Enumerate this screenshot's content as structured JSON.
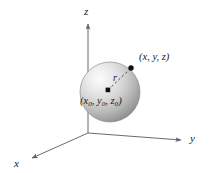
{
  "figure": {
    "background_color": "#ffffff",
    "line_color": "#6b6b6b",
    "text_color": "#1a1a1a"
  },
  "axes": [
    {
      "name": "z",
      "label": "z",
      "direction": "up"
    },
    {
      "name": "y",
      "label": "y",
      "direction": "right"
    },
    {
      "name": "x",
      "label": "x",
      "direction": "lower-left"
    }
  ],
  "labels": {
    "z_axis": "z",
    "y_axis": "y",
    "x_axis": "x",
    "surface_point": "(x, y, z)",
    "center_point_open": "(x",
    "center_point_sub1": "0",
    "center_point_mid1": ", y",
    "center_point_sub2": "0",
    "center_point_mid2": ", z",
    "center_point_sub3": "0",
    "center_point_close": ")",
    "radius": "r"
  },
  "sphere": {
    "center_x": 110,
    "center_y": 92,
    "radius_px": 30,
    "fill_light": "#f2f2f2",
    "fill_mid": "#c9c9c9",
    "fill_dark": "#8e8e8e",
    "edge_color": "#8a8a8a"
  },
  "points": [
    {
      "name": "center",
      "x": 108,
      "y": 90,
      "label": "(x0, y0, z0)"
    },
    {
      "name": "surface",
      "x": 131,
      "y": 68,
      "label": "(x, y, z)"
    }
  ],
  "radius_line": {
    "style": "dashed",
    "from": "center",
    "to": "surface",
    "label": "r"
  }
}
